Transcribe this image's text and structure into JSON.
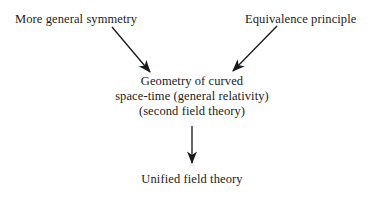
{
  "canvas": {
    "width": 382,
    "height": 205,
    "background_color": "#ffffff",
    "ink_color": "#1b1b1b"
  },
  "diagram": {
    "type": "flow-diagram",
    "title_text": "",
    "nodes": {
      "more_general_symmetry": {
        "label": "More general symmetry"
      },
      "equivalence_principle": {
        "label": "Equivalence principle"
      },
      "geometry_block": {
        "line1": "Geometry of curved",
        "line2": "space-time (general relativity)",
        "line3": "(second field theory)"
      },
      "unified_field_theory": {
        "label": "Unified field theory"
      }
    },
    "arrows": [
      {
        "name": "arrow-symmetry-to-geometry",
        "from": "more_general_symmetry",
        "to": "geometry_block",
        "x1": 112,
        "y1": 27,
        "x2": 152,
        "y2": 74
      },
      {
        "name": "arrow-equivalence-to-geometry",
        "from": "equivalence_principle",
        "to": "geometry_block",
        "x1": 277,
        "y1": 26,
        "x2": 231,
        "y2": 73
      },
      {
        "name": "arrow-geometry-to-unified",
        "from": "geometry_block",
        "to": "unified_field_theory",
        "x1": 192,
        "y1": 126,
        "x2": 192,
        "y2": 165
      }
    ]
  }
}
